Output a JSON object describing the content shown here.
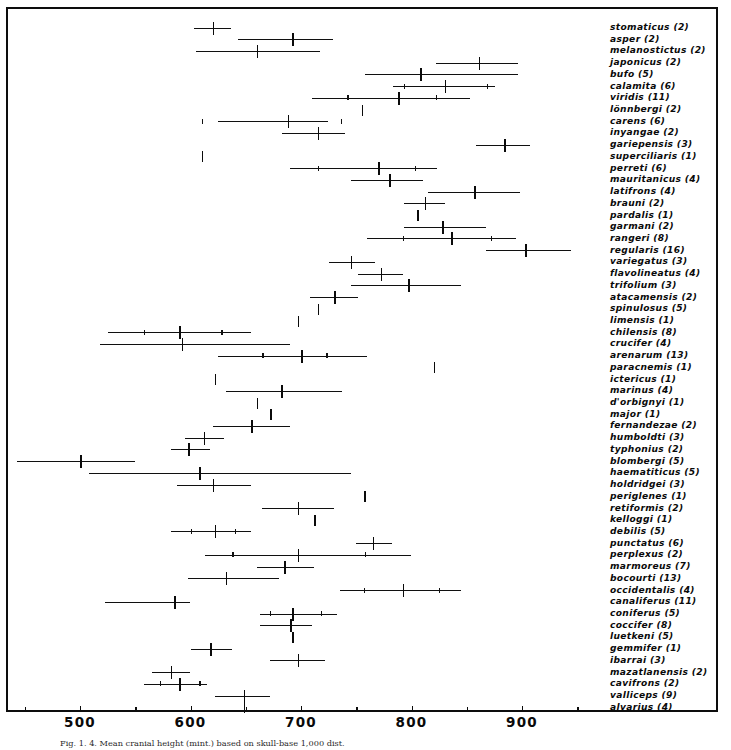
{
  "figure": {
    "caption": "Fig. 1. 4. Mean cranial height (mint.) based on skull-base 1,000 dist.",
    "frame_color": "#0d0d0d"
  },
  "chart_data": {
    "type": "bar",
    "orientation": "horizontal",
    "title": "",
    "subtitle": "",
    "xlabel": "",
    "ylabel": "",
    "xlim": [
      440,
      985
    ],
    "grid": false,
    "legend": null,
    "axis": {
      "major_ticks": [
        500,
        600,
        700,
        800,
        900
      ],
      "major_tick_labels": [
        "500",
        "600",
        "700",
        "800",
        "900"
      ],
      "minor_ticks": [
        450,
        550,
        650,
        750,
        850,
        950
      ],
      "px_per_unit": 1.105,
      "origin_value": 500,
      "origin_px": 80
    },
    "marker_legend": {
      "mean": "heavy vertical stroke = sample mean",
      "range": "horizontal line = observed range",
      "inner": "short vertical ticks = confidence limits",
      "single": "lone vertical stroke = single specimen (n=1)"
    },
    "categories": [
      "stomaticus (2)",
      "asper (2)",
      "melanostictus (2)",
      "japonicus (2)",
      "bufo (5)",
      "calamita (6)",
      "viridis (11)",
      "lönnbergi (2)",
      "carens (6)",
      "inyangae (2)",
      "gariepensis (3)",
      "superciliaris (1)",
      "perreti (6)",
      "mauritanicus (4)",
      "latifrons (4)",
      "brauni (2)",
      "pardalis (1)",
      "garmani (2)",
      "rangeri (8)",
      "regularis (16)",
      "variegatus (3)",
      "flavolineatus (4)",
      "trifolium (3)",
      "atacamensis (2)",
      "spinulosus (5)",
      "limensis (1)",
      "chilensis (8)",
      "crucifer (4)",
      "arenarum (13)",
      "paracnemis (1)",
      "ictericus (1)",
      "marinus (4)",
      "d'orbignyi (1)",
      "major (1)",
      "fernandezae (2)",
      "humboldti (3)",
      "typhonius (2)",
      "blombergi (5)",
      "haematiticus (5)",
      "holdridgei (3)",
      "periglenes (1)",
      "retiformis (2)",
      "kelloggi (1)",
      "debilis (5)",
      "punctatus (6)",
      "perplexus (2)",
      "marmoreus (7)",
      "bocourti (13)",
      "occidentalis (4)",
      "canaliferus (11)",
      "coniferus (5)",
      "coccifer (8)",
      "luetkeni (5)",
      "gemmifer (1)",
      "ibarrai (3)",
      "mazatlanensis (2)",
      "cavifrons (2)",
      "valliceps (9)",
      "alvarius (4)"
    ],
    "series": [
      {
        "name": "stomaticus (2)",
        "n": 2,
        "mean": 620,
        "range": [
          603,
          637
        ],
        "inner": [],
        "single": false
      },
      {
        "name": "asper (2)",
        "n": 2,
        "mean": 692,
        "range": [
          643,
          729
        ],
        "inner": [],
        "single": false
      },
      {
        "name": "melanostictus (2)",
        "n": 2,
        "mean": 660,
        "range": [
          605,
          717
        ],
        "inner": [],
        "single": false
      },
      {
        "name": "japonicus (2)",
        "n": 2,
        "mean": 861,
        "range": [
          822,
          896
        ],
        "inner": [],
        "single": false
      },
      {
        "name": "bufo (5)",
        "n": 5,
        "mean": 808,
        "range": [
          758,
          896
        ],
        "inner": [],
        "single": false
      },
      {
        "name": "calamita (6)",
        "n": 6,
        "mean": 830,
        "range": [
          783,
          876
        ],
        "inner": [
          793,
          868
        ],
        "single": false
      },
      {
        "name": "viridis (11)",
        "n": 11,
        "mean": 788,
        "range": [
          710,
          853
        ],
        "inner": [
          742,
          822
        ],
        "single": false
      },
      {
        "name": "lönnbergi (2)",
        "n": 2,
        "mean": 755,
        "range": [
          755,
          755
        ],
        "inner": [],
        "single": true
      },
      {
        "name": "carens (6)",
        "n": 6,
        "mean": 688,
        "range": [
          625,
          724
        ],
        "inner": [
          610,
          736
        ],
        "single": false
      },
      {
        "name": "inyangae (2)",
        "n": 2,
        "mean": 715,
        "range": [
          683,
          740
        ],
        "inner": [],
        "single": false
      },
      {
        "name": "gariepensis (3)",
        "n": 3,
        "mean": 884,
        "range": [
          858,
          907
        ],
        "inner": [],
        "single": false
      },
      {
        "name": "superciliaris (1)",
        "n": 1,
        "mean": 610,
        "range": [
          610,
          610
        ],
        "inner": [],
        "single": true
      },
      {
        "name": "perreti (6)",
        "n": 6,
        "mean": 770,
        "range": [
          690,
          823
        ],
        "inner": [
          715,
          803
        ],
        "single": false
      },
      {
        "name": "mauritanicus (4)",
        "n": 4,
        "mean": 780,
        "range": [
          745,
          810
        ],
        "inner": [],
        "single": false
      },
      {
        "name": "latifrons (4)",
        "n": 4,
        "mean": 857,
        "range": [
          815,
          898
        ],
        "inner": [],
        "single": false
      },
      {
        "name": "brauni (2)",
        "n": 2,
        "mean": 812,
        "range": [
          793,
          830
        ],
        "inner": [],
        "single": false
      },
      {
        "name": "pardalis (1)",
        "n": 1,
        "mean": 805,
        "range": [
          805,
          805
        ],
        "inner": [],
        "single": true
      },
      {
        "name": "garmani (2)",
        "n": 2,
        "mean": 828,
        "range": [
          793,
          867
        ],
        "inner": [],
        "single": false
      },
      {
        "name": "rangeri (8)",
        "n": 8,
        "mean": 836,
        "range": [
          760,
          895
        ],
        "inner": [
          792,
          872
        ],
        "single": false
      },
      {
        "name": "regularis (16)",
        "n": 16,
        "mean": 903,
        "range": [
          867,
          944
        ],
        "inner": [],
        "single": false
      },
      {
        "name": "variegatus (3)",
        "n": 3,
        "mean": 745,
        "range": [
          725,
          767
        ],
        "inner": [],
        "single": false
      },
      {
        "name": "flavolineatus (4)",
        "n": 4,
        "mean": 772,
        "range": [
          752,
          792
        ],
        "inner": [],
        "single": false
      },
      {
        "name": "trifolium (3)",
        "n": 3,
        "mean": 797,
        "range": [
          745,
          845
        ],
        "inner": [],
        "single": false
      },
      {
        "name": "atacamensis (2)",
        "n": 2,
        "mean": 730,
        "range": [
          708,
          752
        ],
        "inner": [],
        "single": false
      },
      {
        "name": "spinulosus (5)",
        "n": 5,
        "mean": 715,
        "range": [
          693,
          740
        ],
        "inner": [],
        "single": true
      },
      {
        "name": "limensis (1)",
        "n": 1,
        "mean": 697,
        "range": [
          697,
          697
        ],
        "inner": [],
        "single": true
      },
      {
        "name": "chilensis (8)",
        "n": 8,
        "mean": 590,
        "range": [
          525,
          655
        ],
        "inner": [
          558,
          628
        ],
        "single": false
      },
      {
        "name": "crucifer (4)",
        "n": 4,
        "mean": 592,
        "range": [
          518,
          690
        ],
        "inner": [],
        "single": false
      },
      {
        "name": "arenarum (13)",
        "n": 13,
        "mean": 700,
        "range": [
          625,
          760
        ],
        "inner": [
          665,
          723
        ],
        "single": false
      },
      {
        "name": "paracnemis (1)",
        "n": 1,
        "mean": 820,
        "range": [
          820,
          820
        ],
        "inner": [],
        "single": true
      },
      {
        "name": "ictericus (1)",
        "n": 1,
        "mean": 622,
        "range": [
          622,
          622
        ],
        "inner": [],
        "single": true
      },
      {
        "name": "marinus (4)",
        "n": 4,
        "mean": 682,
        "range": [
          632,
          737
        ],
        "inner": [],
        "single": false
      },
      {
        "name": "d'orbignyi (1)",
        "n": 1,
        "mean": 660,
        "range": [
          660,
          660
        ],
        "inner": [],
        "single": true
      },
      {
        "name": "major (1)",
        "n": 1,
        "mean": 672,
        "range": [
          672,
          672
        ],
        "inner": [],
        "single": true
      },
      {
        "name": "fernandezae (2)",
        "n": 2,
        "mean": 655,
        "range": [
          620,
          690
        ],
        "inner": [],
        "single": false
      },
      {
        "name": "humboldti (3)",
        "n": 3,
        "mean": 612,
        "range": [
          595,
          630
        ],
        "inner": [],
        "single": false
      },
      {
        "name": "typhonius (2)",
        "n": 2,
        "mean": 598,
        "range": [
          582,
          618
        ],
        "inner": [],
        "single": false
      },
      {
        "name": "blombergi (5)",
        "n": 5,
        "mean": 500,
        "range": [
          443,
          550
        ],
        "inner": [],
        "single": false
      },
      {
        "name": "haematiticus (5)",
        "n": 5,
        "mean": 608,
        "range": [
          508,
          745
        ],
        "inner": [],
        "single": false
      },
      {
        "name": "holdridgei (3)",
        "n": 3,
        "mean": 620,
        "range": [
          588,
          655
        ],
        "inner": [],
        "single": false
      },
      {
        "name": "periglenes (1)",
        "n": 1,
        "mean": 757,
        "range": [
          757,
          757
        ],
        "inner": [],
        "single": true
      },
      {
        "name": "retiformis (2)",
        "n": 2,
        "mean": 697,
        "range": [
          665,
          730
        ],
        "inner": [],
        "single": false
      },
      {
        "name": "kelloggi (1)",
        "n": 1,
        "mean": 712,
        "range": [
          712,
          712
        ],
        "inner": [],
        "single": true
      },
      {
        "name": "debilis (5)",
        "n": 5,
        "mean": 622,
        "range": [
          582,
          655
        ],
        "inner": [
          600,
          640
        ],
        "single": false
      },
      {
        "name": "punctatus (6)",
        "n": 6,
        "mean": 765,
        "range": [
          750,
          782
        ],
        "inner": [],
        "single": false
      },
      {
        "name": "perplexus (2)",
        "n": 2,
        "mean": 697,
        "range": [
          613,
          800
        ],
        "inner": [
          638,
          758
        ],
        "single": false
      },
      {
        "name": "marmoreus (7)",
        "n": 7,
        "mean": 685,
        "range": [
          660,
          712
        ],
        "inner": [],
        "single": false
      },
      {
        "name": "bocourti (13)",
        "n": 13,
        "mean": 632,
        "range": [
          598,
          680
        ],
        "inner": [],
        "single": false
      },
      {
        "name": "occidentalis (4)",
        "n": 4,
        "mean": 792,
        "range": [
          735,
          845
        ],
        "inner": [
          757,
          825
        ],
        "single": false
      },
      {
        "name": "canaliferus (11)",
        "n": 11,
        "mean": 585,
        "range": [
          523,
          600
        ],
        "inner": [],
        "single": false
      },
      {
        "name": "coniferus (5)",
        "n": 5,
        "mean": 692,
        "range": [
          663,
          733
        ],
        "inner": [
          672,
          718
        ],
        "single": false
      },
      {
        "name": "coccifer (8)",
        "n": 8,
        "mean": 690,
        "range": [
          663,
          710
        ],
        "inner": [],
        "single": false
      },
      {
        "name": "luetkeni (5)",
        "n": 5,
        "mean": 692,
        "range": [
          692,
          692
        ],
        "inner": [],
        "single": true
      },
      {
        "name": "gemmifer (1)",
        "n": 1,
        "mean": 618,
        "range": [
          600,
          638
        ],
        "inner": [],
        "single": false
      },
      {
        "name": "ibarrai (3)",
        "n": 3,
        "mean": 697,
        "range": [
          672,
          722
        ],
        "inner": [],
        "single": false
      },
      {
        "name": "mazatlanensis (2)",
        "n": 2,
        "mean": 582,
        "range": [
          565,
          600
        ],
        "inner": [],
        "single": false
      },
      {
        "name": "cavifrons (2)",
        "n": 2,
        "mean": 590,
        "range": [
          558,
          615
        ],
        "inner": [
          572,
          608
        ],
        "single": false
      },
      {
        "name": "valliceps (9)",
        "n": 9,
        "mean": 648,
        "range": [
          622,
          672
        ],
        "inner": [],
        "single": false
      },
      {
        "name": "alvarius (4)",
        "n": 4,
        "mean": 648,
        "range": [
          648,
          648
        ],
        "inner": [],
        "single": true
      }
    ]
  }
}
